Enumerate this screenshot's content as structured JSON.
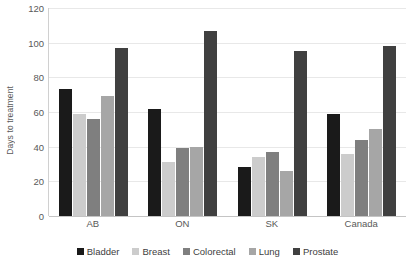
{
  "chart_data": {
    "type": "bar",
    "title": "",
    "xlabel": "",
    "ylabel": "Days to treatment",
    "ylim": [
      0,
      120
    ],
    "yticks": [
      0,
      20,
      40,
      60,
      80,
      100,
      120
    ],
    "grid": true,
    "legend_position": "bottom",
    "categories": [
      "AB",
      "ON",
      "SK",
      "Canada"
    ],
    "series": [
      {
        "name": "Bladder",
        "color": "#1a1a1a",
        "values": [
          73,
          62,
          28,
          59
        ]
      },
      {
        "name": "Breast",
        "color": "#cccccc",
        "values": [
          59,
          31,
          34,
          36
        ]
      },
      {
        "name": "Colorectal",
        "color": "#7f7f7f",
        "values": [
          56,
          39,
          37,
          44
        ]
      },
      {
        "name": "Lung",
        "color": "#a6a6a6",
        "values": [
          69,
          40,
          26,
          50
        ]
      },
      {
        "name": "Prostate",
        "color": "#404040",
        "values": [
          97,
          107,
          95,
          98
        ]
      }
    ]
  }
}
